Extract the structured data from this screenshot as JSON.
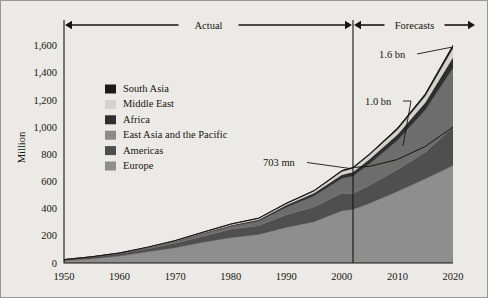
{
  "chart_data": {
    "type": "area",
    "title": "",
    "subtitle": "",
    "xlabel": "",
    "ylabel": "Million",
    "xlim": [
      1950,
      2020
    ],
    "ylim": [
      0,
      1700
    ],
    "yticks": [
      "0",
      "200",
      "400",
      "600",
      "800",
      "1,000",
      "1,200",
      "1,400",
      "1,600"
    ],
    "ytick_values": [
      0,
      200,
      400,
      600,
      800,
      1000,
      1200,
      1400,
      1600
    ],
    "xticks": [
      "1950",
      "1960",
      "1970",
      "1980",
      "1990",
      "2000",
      "2010",
      "2020"
    ],
    "xtick_values": [
      1950,
      1960,
      1970,
      1980,
      1990,
      2000,
      2010,
      2020
    ],
    "grid": false,
    "legend_position": "upper-left-inside",
    "stacking_order_bottom_to_top": [
      "Europe",
      "Americas",
      "East Asia and the Pacific",
      "Africa",
      "Middle East",
      "South Asia"
    ],
    "x": [
      1950,
      1955,
      1960,
      1965,
      1970,
      1975,
      1980,
      1985,
      1990,
      1995,
      2000,
      2002,
      2005,
      2010,
      2015,
      2020
    ],
    "series": [
      {
        "name": "Europe",
        "color": "#8e8e8e",
        "values": [
          17,
          31,
          51,
          82,
          113,
          153,
          186,
          210,
          262,
          304,
          385,
          394,
          440,
          527,
          620,
          717
        ]
      },
      {
        "name": "Americas",
        "color": "#4f4f4f",
        "values": [
          7,
          13,
          18,
          23,
          33,
          43,
          62,
          65,
          93,
          109,
          128,
          115,
          132,
          160,
          195,
          282
        ]
      },
      {
        "name": "East Asia and the Pacific",
        "color": "#6d6d6d",
        "values": [
          0,
          1,
          3,
          6,
          11,
          19,
          23,
          33,
          56,
          82,
          110,
          131,
          160,
          216,
          312,
          438
        ]
      },
      {
        "name": "Africa",
        "color": "#2e2e2e",
        "values": [
          1,
          1,
          1,
          2,
          3,
          5,
          7,
          10,
          15,
          20,
          27,
          29,
          33,
          42,
          55,
          77
        ]
      },
      {
        "name": "Middle East",
        "color": "#d4d2cd",
        "values": [
          0,
          0,
          1,
          2,
          4,
          5,
          7,
          9,
          10,
          14,
          24,
          28,
          31,
          36,
          47,
          69
        ]
      },
      {
        "name": "South Asia",
        "color": "#1a1a1a",
        "values": [
          0,
          0,
          0,
          1,
          1,
          2,
          2,
          3,
          4,
          4,
          6,
          6,
          7,
          11,
          14,
          19
        ]
      }
    ],
    "totals": [
      25,
      46,
      74,
      116,
      165,
      227,
      287,
      330,
      440,
      533,
      680,
      703,
      803,
      992,
      1243,
      1602
    ],
    "forecast_start_year": 2002,
    "annotations": [
      {
        "label": "703 mn",
        "year": 2002,
        "value": 703
      },
      {
        "label": "1.0 bn",
        "year": 2010,
        "value": 1000
      },
      {
        "label": "1.6 bn",
        "year": 2020,
        "value": 1600
      }
    ],
    "period_labels": [
      {
        "label": "Actual",
        "from": 1950,
        "to": 2002
      },
      {
        "label": "Forecasts",
        "from": 2002,
        "to": 2020
      }
    ]
  },
  "legend": {
    "items": [
      {
        "label": "South Asia",
        "color": "#1a1a1a"
      },
      {
        "label": "Middle East",
        "color": "#d4d2cd"
      },
      {
        "label": "Africa",
        "color": "#2e2e2e"
      },
      {
        "label": "East Asia and the Pacific",
        "color": "#8b8b8b"
      },
      {
        "label": "Americas",
        "color": "#4f4f4f"
      },
      {
        "label": "Europe",
        "color": "#8e8e8e"
      }
    ]
  },
  "axes": {
    "y_title": "Million",
    "y_ticks": [
      "1,600",
      "1,400",
      "1,200",
      "1,000",
      "800",
      "600",
      "400",
      "200",
      "0"
    ],
    "x_ticks": [
      "1950",
      "1960",
      "1970",
      "1980",
      "1990",
      "2000",
      "2010",
      "2020"
    ]
  },
  "annotations": {
    "actual": "Actual",
    "forecasts": "Forecasts",
    "value_703": "703 mn",
    "value_10bn": "1.0 bn",
    "value_16bn": "1.6 bn"
  },
  "colors": {
    "background": "#eceae6",
    "frame": "#9a9892",
    "ink": "#17150f"
  }
}
